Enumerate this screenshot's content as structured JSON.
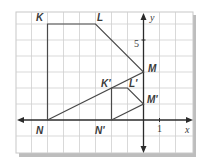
{
  "figure": {
    "type": "coordinate-plane-dilation",
    "axes": {
      "x_label": "x",
      "y_label": "y",
      "x_tick_label": "1",
      "y_tick_label": "5",
      "x_range": [
        -8,
        3
      ],
      "y_range": [
        -2,
        7
      ]
    },
    "original": {
      "name": "KLMN",
      "vertices": [
        {
          "label": "K",
          "x": -6,
          "y": 6
        },
        {
          "label": "L",
          "x": -3,
          "y": 6
        },
        {
          "label": "M",
          "x": 0,
          "y": 3
        },
        {
          "label": "N",
          "x": -6,
          "y": 0
        }
      ]
    },
    "image": {
      "name": "K'L'M'N'",
      "vertices": [
        {
          "label": "K'",
          "x": -2,
          "y": 2
        },
        {
          "label": "L'",
          "x": -1,
          "y": 2
        },
        {
          "label": "M'",
          "x": 0,
          "y": 1
        },
        {
          "label": "N'",
          "x": -2,
          "y": 0
        }
      ]
    },
    "colors": {
      "grid": "#c8c8c8",
      "axis": "#2b2b2b",
      "figure_stroke": "#4a4a4a",
      "label": "#3a3a3a",
      "shadow": "#b8b8b8"
    }
  }
}
